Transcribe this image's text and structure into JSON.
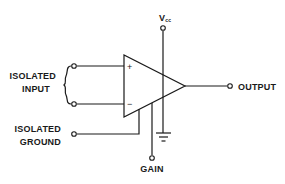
{
  "diagram": {
    "labels": {
      "vcc": "V",
      "vcc_sub": "cc",
      "isolated_input_line1": "ISOLATED",
      "isolated_input_line2": "INPUT",
      "isolated_ground_line1": "ISOLATED",
      "isolated_ground_line2": "GROUND",
      "output": "OUTPUT",
      "gain": "GAIN",
      "plus": "+",
      "minus": "−"
    },
    "colors": {
      "ink": "#1a1a1a",
      "background": "#ffffff"
    }
  }
}
